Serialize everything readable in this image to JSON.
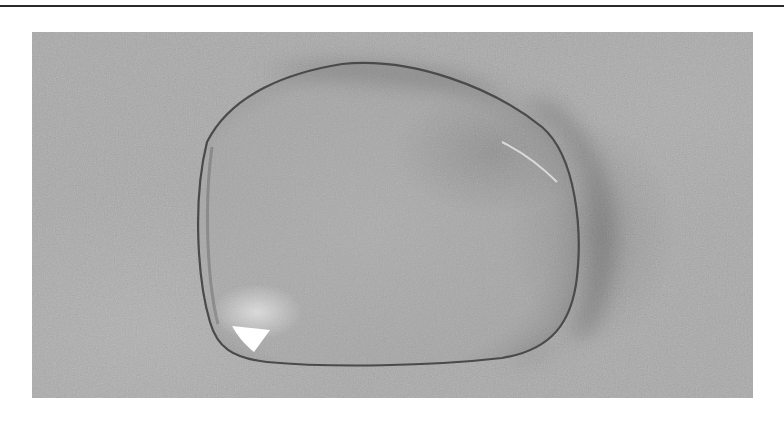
{
  "figure": {
    "colors": {
      "background": "#ffffff",
      "rule": "#2a2a2a",
      "fabric": "#a9a9a9",
      "droplet_edge": "#4a4a4a",
      "highlight": "#ffffff"
    }
  }
}
